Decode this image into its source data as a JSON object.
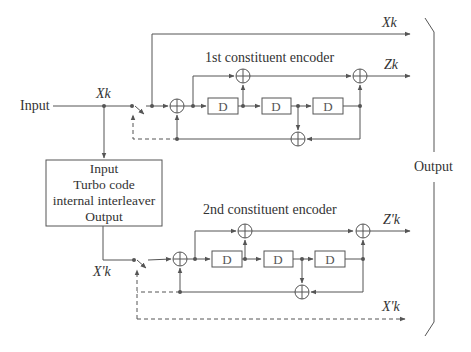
{
  "diagram": {
    "input_label": "Input",
    "output_label": "Output",
    "signals": {
      "xk_input": "Xk",
      "xk_output": "Xk",
      "zk": "Zk",
      "zpk": "Z'k",
      "xpk_switch": "X'k",
      "xpk_output": "X'k"
    },
    "encoder1": {
      "title": "1st constituent encoder",
      "delay": "D"
    },
    "encoder2": {
      "title": "2nd constituent encoder",
      "delay": "D"
    },
    "interleaver": {
      "line1": "Input",
      "line2": "Turbo code",
      "line3": "internal interleaver",
      "line4": "Output"
    },
    "colors": {
      "line": "#555555",
      "text": "#333333",
      "box_fill": "#ffffff"
    }
  }
}
